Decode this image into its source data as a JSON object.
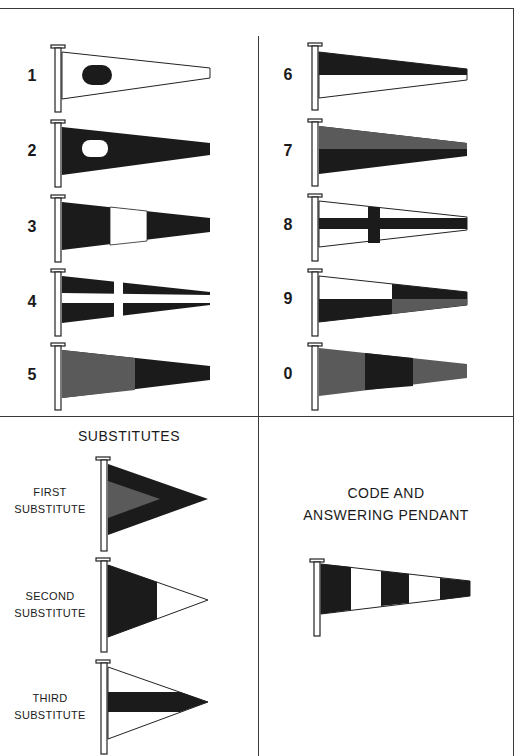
{
  "colors": {
    "dark": "#1b1b1b",
    "mid": "#5a5a5a",
    "light": "#ffffff",
    "line": "#222222"
  },
  "numeral_pendants": [
    {
      "label": "1",
      "design": "white with dark oval"
    },
    {
      "label": "2",
      "design": "dark with white oval"
    },
    {
      "label": "3",
      "design": "dark-white-dark vertical bands"
    },
    {
      "label": "4",
      "design": "dark with white cross"
    },
    {
      "label": "5",
      "design": "mid-grey hoist, dark fly"
    },
    {
      "label": "6",
      "design": "dark top half, white bottom"
    },
    {
      "label": "7",
      "design": "mid-grey top, dark bottom"
    },
    {
      "label": "8",
      "design": "white with dark cross"
    },
    {
      "label": "9",
      "design": "quartered white/dark/dark/grey"
    },
    {
      "label": "0",
      "design": "grey-dark-grey vertical bands"
    }
  ],
  "substitutes": {
    "title": "SUBSTITUTES",
    "items": [
      {
        "line1": "FIRST",
        "line2": "SUBSTITUTE"
      },
      {
        "line1": "SECOND",
        "line2": "SUBSTITUTE"
      },
      {
        "line1": "THIRD",
        "line2": "SUBSTITUTE"
      }
    ]
  },
  "code_pendant": {
    "line1": "CODE AND",
    "line2": "ANSWERING PENDANT"
  }
}
